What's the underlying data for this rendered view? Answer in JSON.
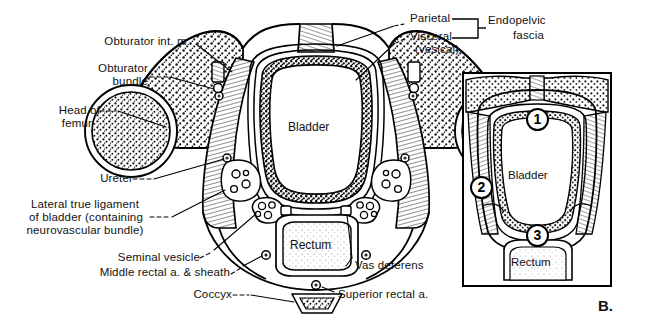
{
  "figure": {
    "panel_letter": "B.",
    "type": "anatomical-cross-section"
  },
  "labels": {
    "obturator_int_m": "Obturator int. m.",
    "obturator_bundle_l1": "Obturator",
    "obturator_bundle_l2": "bundle",
    "head_of_femur_l1": "Head of",
    "head_of_femur_l2": "femur",
    "ureter": "Ureter",
    "lateral_lig_l1": "Lateral true ligament",
    "lateral_lig_l2": "of bladder (containing",
    "lateral_lig_l3": "neurovascular bundle)",
    "seminal_vesicle": "Seminal vesicle",
    "middle_rectal": "Middle rectal a. & sheath",
    "coccyx": "Coccyx",
    "vas_deferens": "Vas deferens",
    "superior_rectal": "Superior rectal a.",
    "parietal": "Parietal",
    "visceral": "Visceral",
    "vesical": "(vesical)",
    "endopelvic_l1": "Endopelvic",
    "endopelvic_l2": "fascia"
  },
  "organs": {
    "bladder_main": "Bladder",
    "rectum_main": "Rectum",
    "bladder_inset": "Bladder",
    "rectum_inset": "Rectum"
  },
  "inset_markers": [
    {
      "id": "1",
      "label": "1"
    },
    {
      "id": "2",
      "label": "2"
    },
    {
      "id": "3",
      "label": "3"
    }
  ],
  "colors": {
    "ink": "#111111",
    "line": "#000000",
    "paper": "#ffffff",
    "bone_stipple": "#222222",
    "muscle_hatch": "#555555"
  }
}
